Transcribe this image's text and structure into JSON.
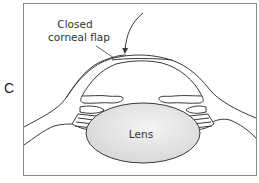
{
  "figure": {
    "panel_label": "C",
    "annotations": {
      "flap_line1": "Closed",
      "flap_line2": "corneal flap",
      "lens": "Lens"
    },
    "colors": {
      "stroke": "#3a3a3a",
      "frame": "#8a8a8a",
      "lens_fill": "#e6e6e6",
      "background": "#ffffff"
    }
  }
}
